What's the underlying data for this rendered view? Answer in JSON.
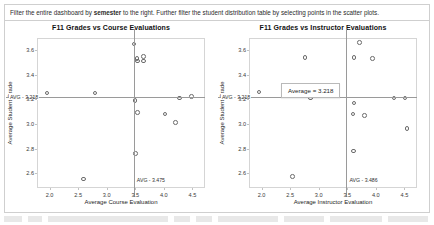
{
  "banner": {
    "text_before": "Filter the entire dashboard by ",
    "bold_word": "semester",
    "text_after": " to the right. Further filter the student distribution table by selecting points in the scatter plots."
  },
  "tooltip": {
    "label": "Average = 3.218"
  },
  "colors": {
    "point_stroke": "#6b6b6b",
    "reference_line": "#9a9a9a",
    "panel_border": "#cfcfcf",
    "axis": "#d5d5d5",
    "text": "#262626"
  },
  "chart_data": [
    {
      "type": "scatter",
      "title": "F11 Grades vs Course Evaluations",
      "xlabel": "Average Course Evaluation",
      "ylabel": "Average Student Grade",
      "xlim": [
        1.78,
        4.72
      ],
      "ylim": [
        2.48,
        3.7
      ],
      "xticks": [
        "2.0",
        "2.5",
        "3.0",
        "3.5",
        "4.0",
        "4.5"
      ],
      "xtick_values": [
        2.0,
        2.5,
        3.0,
        3.5,
        4.0,
        4.5
      ],
      "yticks": [
        "3.6",
        "3.4",
        "3.2",
        "3.0",
        "2.8",
        "2.6"
      ],
      "ytick_values": [
        3.6,
        3.4,
        3.2,
        3.0,
        2.8,
        2.6
      ],
      "grid": false,
      "legend": "none",
      "reference_lines": [
        {
          "orient": "horizontal",
          "value": 3.218,
          "label": "AVG - 3.218"
        },
        {
          "orient": "vertical",
          "value": 3.475,
          "label": "AVG - 3.475"
        }
      ],
      "points": [
        {
          "x": 3.46,
          "y": 3.66
        },
        {
          "x": 3.51,
          "y": 3.54
        },
        {
          "x": 3.63,
          "y": 3.56
        },
        {
          "x": 3.63,
          "y": 3.52
        },
        {
          "x": 3.52,
          "y": 3.52
        },
        {
          "x": 1.94,
          "y": 3.26
        },
        {
          "x": 2.78,
          "y": 3.26
        },
        {
          "x": 3.48,
          "y": 3.2
        },
        {
          "x": 4.26,
          "y": 3.22
        },
        {
          "x": 4.47,
          "y": 3.23
        },
        {
          "x": 3.52,
          "y": 3.1
        },
        {
          "x": 4.0,
          "y": 3.09
        },
        {
          "x": 4.19,
          "y": 3.02
        },
        {
          "x": 3.49,
          "y": 2.77
        },
        {
          "x": 2.58,
          "y": 2.56
        }
      ]
    },
    {
      "type": "scatter",
      "title": "F11 Grades vs Instructor Evaluations",
      "xlabel": "Average Instructor Evaluation",
      "ylabel": "Average Student Grade",
      "xlim": [
        1.78,
        4.72
      ],
      "ylim": [
        2.48,
        3.7
      ],
      "xticks": [
        "2.0",
        "2.5",
        "3.0",
        "3.5",
        "4.0",
        "4.5"
      ],
      "xtick_values": [
        2.0,
        2.5,
        3.0,
        3.5,
        4.0,
        4.5
      ],
      "yticks": [
        "3.6",
        "3.4",
        "3.2",
        "3.0",
        "2.8",
        "2.6"
      ],
      "ytick_values": [
        3.6,
        3.4,
        3.2,
        3.0,
        2.8,
        2.6
      ],
      "grid": false,
      "legend": "none",
      "reference_lines": [
        {
          "orient": "horizontal",
          "value": 3.218,
          "label": "AVG - 3.218"
        },
        {
          "orient": "vertical",
          "value": 3.486,
          "label": "AVG - 3.486"
        }
      ],
      "points": [
        {
          "x": 3.7,
          "y": 3.67
        },
        {
          "x": 3.6,
          "y": 3.55
        },
        {
          "x": 3.92,
          "y": 3.54
        },
        {
          "x": 2.74,
          "y": 3.55
        },
        {
          "x": 1.94,
          "y": 3.27
        },
        {
          "x": 2.84,
          "y": 3.22
        },
        {
          "x": 3.6,
          "y": 3.18
        },
        {
          "x": 4.3,
          "y": 3.22
        },
        {
          "x": 4.49,
          "y": 3.22
        },
        {
          "x": 3.58,
          "y": 3.09
        },
        {
          "x": 3.78,
          "y": 3.08
        },
        {
          "x": 4.53,
          "y": 2.97
        },
        {
          "x": 3.59,
          "y": 2.79
        },
        {
          "x": 2.52,
          "y": 2.58
        }
      ]
    }
  ]
}
